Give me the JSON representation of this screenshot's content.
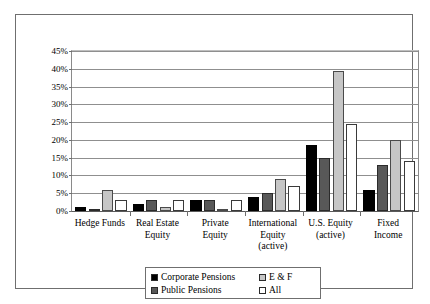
{
  "chart_data": {
    "type": "bar",
    "title": "",
    "subtitle": "",
    "xlabel": "",
    "ylabel": "",
    "ylim": [
      0,
      45
    ],
    "ytick_step": 5,
    "ytick_labels": [
      "0%",
      "5%",
      "10%",
      "15%",
      "20%",
      "25%",
      "30%",
      "35%",
      "40%",
      "45%"
    ],
    "grid": true,
    "legend_position": "bottom-center",
    "categories": [
      "Hedge Funds",
      "Real Estate\nEquity",
      "Private\nEquity",
      "International\nEquity\n(active)",
      "U.S. Equity\n(active)",
      "Fixed\nIncome"
    ],
    "series": [
      {
        "name": "Corporate Pensions",
        "color": "#000000",
        "values": [
          1.0,
          2.0,
          3.0,
          4.0,
          18.5,
          6.0
        ]
      },
      {
        "name": "Public Pensions",
        "color": "#585858",
        "values": [
          0.3,
          3.0,
          3.0,
          5.0,
          15.0,
          13.0
        ]
      },
      {
        "name": "E & F",
        "color": "#c6c6c6",
        "values": [
          6.0,
          1.0,
          0.3,
          9.0,
          39.5,
          20.0
        ]
      },
      {
        "name": "All",
        "color": "#ffffff",
        "values": [
          3.0,
          3.0,
          3.0,
          7.0,
          24.5,
          14.0
        ]
      }
    ]
  },
  "legend": {
    "entries": [
      {
        "label": "Corporate Pensions",
        "color": "#000000"
      },
      {
        "label": "E & F",
        "color": "#c6c6c6"
      },
      {
        "label": "Public Pensions",
        "color": "#585858"
      },
      {
        "label": "All",
        "color": "#ffffff"
      }
    ]
  }
}
